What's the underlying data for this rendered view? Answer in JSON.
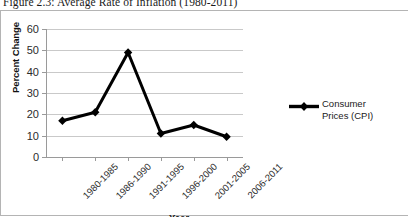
{
  "figure": {
    "caption": "Figure 2.3: Average Rate of Inflation (1980-2011)"
  },
  "chart_data": {
    "type": "line",
    "title": "Figure 2.3: Average Rate of Inflation (1980-2011)",
    "xlabel": "Year",
    "ylabel": "Percent Change",
    "ylim": [
      0,
      60
    ],
    "ytick_step": 10,
    "yticks": [
      0,
      10,
      20,
      30,
      40,
      50,
      60
    ],
    "ytick_labels": [
      "0",
      "10",
      "20",
      "30",
      "40",
      "50",
      "60"
    ],
    "categories": [
      "1980-1985",
      "1986-1990",
      "1991-1995",
      "1996-2000",
      "2001-2005",
      "2006-2011"
    ],
    "grid": true,
    "legend_position": "right",
    "series": [
      {
        "name": "Consumer Prices (CPI)",
        "legend_label": "Consumer\nPrices (CPI)",
        "color": "#000000",
        "marker": "diamond",
        "values": [
          17,
          21,
          49,
          11,
          15,
          9.5
        ]
      }
    ]
  }
}
